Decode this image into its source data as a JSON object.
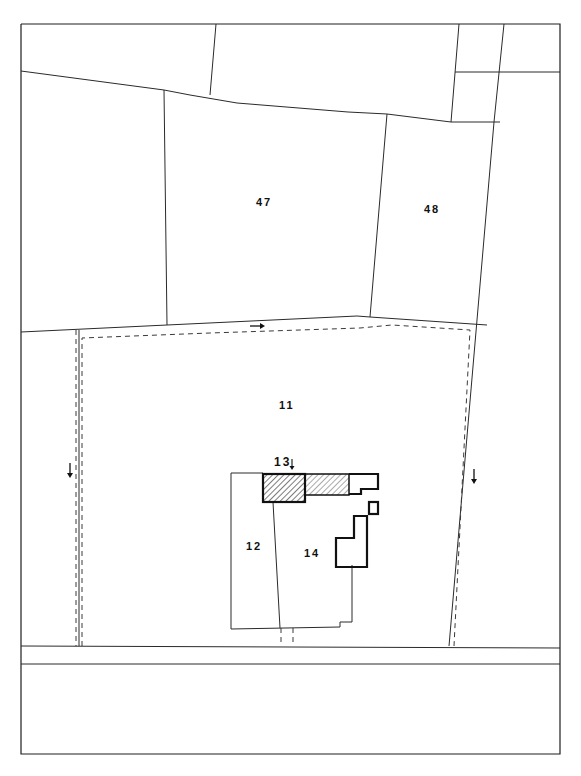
{
  "map": {
    "type": "cadastral-site-plan",
    "parcels": [
      {
        "id": "47",
        "label": "47",
        "x": 256,
        "y": 203
      },
      {
        "id": "48",
        "label": "48",
        "x": 424,
        "y": 209
      },
      {
        "id": "11",
        "label": "11",
        "x": 279,
        "y": 405
      },
      {
        "id": "12",
        "label": "12",
        "x": 247,
        "y": 545
      },
      {
        "id": "13",
        "label": "13",
        "x": 275,
        "y": 460
      },
      {
        "id": "14",
        "label": "14",
        "x": 305,
        "y": 552
      }
    ],
    "arrows": [
      {
        "name": "arrow-right-top",
        "direction": "right",
        "x": 250,
        "y": 326
      },
      {
        "name": "arrow-down-left",
        "direction": "down",
        "x": 69,
        "y": 470
      },
      {
        "name": "arrow-down-right",
        "direction": "down",
        "x": 474,
        "y": 480
      },
      {
        "name": "arrow-down-13",
        "direction": "down",
        "x": 292,
        "y": 463
      }
    ],
    "colors": {
      "ink": "#1e1e1e",
      "paper": "#ffffff"
    }
  }
}
